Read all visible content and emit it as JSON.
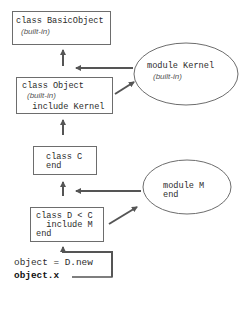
{
  "diagram": {
    "nodes": {
      "basic_object": {
        "line1": "class BasicObject",
        "note": "(built-in)"
      },
      "object": {
        "line1": "class Object",
        "note": "(built-in)",
        "line3": "  include Kernel"
      },
      "kernel": {
        "line1": "module Kernel",
        "note": "(built-in)"
      },
      "class_c": {
        "line1": "class C",
        "line2": "end"
      },
      "module_m": {
        "line1": "module M",
        "line2": "end"
      },
      "class_d": {
        "line1": "class D < C",
        "line2": "  include M",
        "line3": "end"
      }
    },
    "code": {
      "line1": "object = D.new",
      "line2": "object.x"
    },
    "edges": [
      {
        "from": "class_d",
        "to": "class_c",
        "type": "superclass-lookup"
      },
      {
        "from": "module_m",
        "to": "class_c-lookup-path",
        "type": "module-insert"
      },
      {
        "from": "class_d",
        "to": "module_m",
        "type": "include"
      },
      {
        "from": "class_c",
        "to": "object",
        "type": "superclass-lookup"
      },
      {
        "from": "kernel",
        "to": "basic_object-lookup-path",
        "type": "module-insert"
      },
      {
        "from": "object",
        "to": "kernel",
        "type": "include"
      },
      {
        "from": "object",
        "to": "basic_object",
        "type": "superclass-lookup"
      },
      {
        "from": "code",
        "to": "class_d",
        "type": "method-call"
      }
    ],
    "colors": {
      "stroke": "#6d6d6d",
      "arrow": "#555555",
      "text": "#2b2b2b"
    }
  }
}
